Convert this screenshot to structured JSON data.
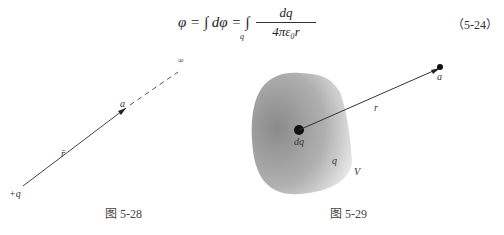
{
  "equation": {
    "lhs": "φ = ∫ dφ = ∫",
    "subscript": "q",
    "numerator": "dq",
    "denominator": "4πε₀r",
    "number": "（5-24）"
  },
  "figure_528": {
    "caption": "图 5-28",
    "labels": {
      "charge": "+q",
      "point": "a",
      "vector": "r̄",
      "infinity": "∞"
    }
  },
  "figure_529": {
    "caption": "图 5-29",
    "labels": {
      "element": "dq",
      "distance": "r",
      "point": "a",
      "charge": "q",
      "volume": "V"
    }
  }
}
